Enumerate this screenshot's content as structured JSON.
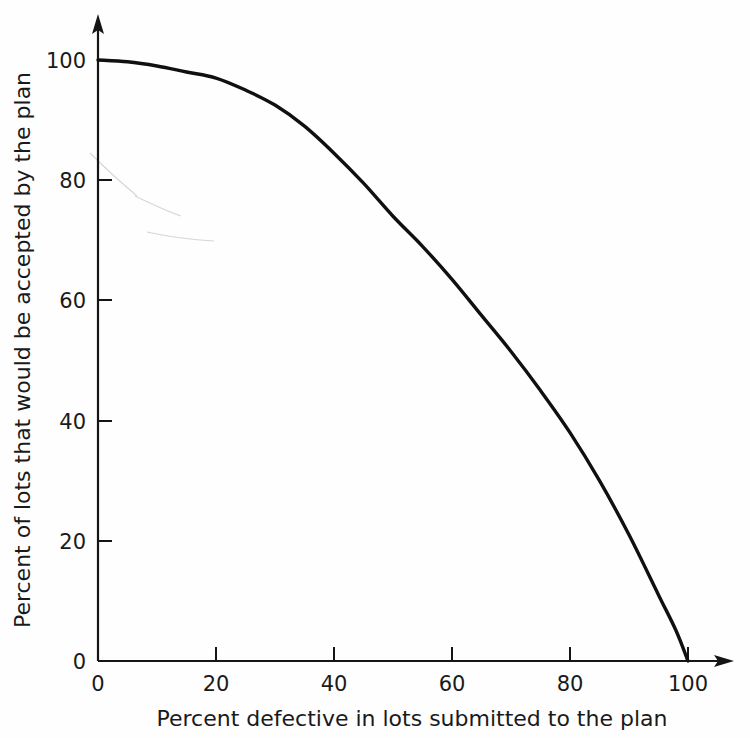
{
  "figure": {
    "background_color": "#fefefe",
    "axis_color": "#151515",
    "curve_color": "#101010"
  },
  "axes": {
    "x_title": "Percent defective in lots submitted to the plan",
    "y_title": "Percent of lots that would be accepted by the plan",
    "x_ticks": [
      "0",
      "20",
      "40",
      "60",
      "80",
      "100"
    ],
    "y_ticks": [
      "0",
      "20",
      "40",
      "60",
      "80",
      "100"
    ]
  },
  "chart_data": {
    "type": "line",
    "title": "",
    "subtitle": "",
    "xlabel": "Percent defective in lots submitted to the plan",
    "ylabel": "Percent of lots that would be accepted by the plan",
    "xlim": [
      0,
      100
    ],
    "ylim": [
      0,
      100
    ],
    "xticks": [
      0,
      20,
      40,
      60,
      80,
      100
    ],
    "yticks": [
      0,
      20,
      40,
      60,
      80,
      100
    ],
    "grid": false,
    "legend": null,
    "legend_position": "none",
    "annotations": [],
    "series": [
      {
        "name": "Operating characteristic curve",
        "x": [
          0,
          5,
          10,
          15,
          20,
          25,
          30,
          35,
          40,
          45,
          50,
          55,
          60,
          65,
          70,
          75,
          80,
          85,
          90,
          95,
          98,
          100
        ],
        "values": [
          100,
          99.7,
          99,
          98,
          97,
          95,
          92.5,
          89,
          84.5,
          79.5,
          74,
          69,
          63.5,
          57.5,
          51.5,
          45,
          38,
          30,
          21,
          11,
          5,
          0
        ]
      }
    ]
  }
}
